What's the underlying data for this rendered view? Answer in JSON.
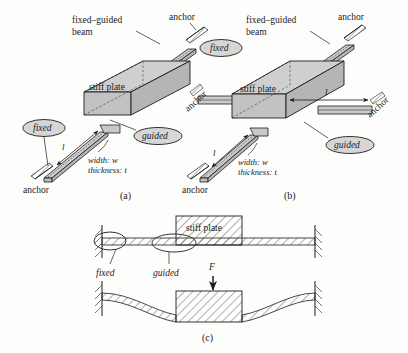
{
  "figure": {
    "caption_a": "(a)",
    "caption_b": "(b)",
    "caption_c": "(c)"
  },
  "panel_a": {
    "beam_label_line1": "fixed–guided",
    "beam_label_line2": "beam",
    "plate_label": "stiff plate",
    "anchor_top": "anchor",
    "anchor_bottom": "anchor",
    "badge_fixed": "fixed",
    "badge_guided": "guided",
    "dim_length": "l",
    "dim_width": "width: w",
    "dim_thickness": "thickness: t"
  },
  "panel_b": {
    "beam_label_line1": "fixed–guided",
    "beam_label_line2": "beam",
    "plate_label": "stiff plate",
    "anchor_top": "anchor",
    "anchor_bottom": "anchor",
    "anchor_left": "anchor",
    "anchor_right": "anchor",
    "badge_fixed": "fixed",
    "badge_guided": "guided",
    "dim_length_left": "l",
    "dim_length_right": "l",
    "dim_width": "width: w",
    "dim_thickness": "thickness: t"
  },
  "panel_c": {
    "plate_label": "stiff plate",
    "label_fixed": "fixed",
    "label_guided": "guided",
    "force_label": "F"
  },
  "colors": {
    "ink": "#1c1c1c",
    "plate_top": "#cfcfcf",
    "plate_front": "#c2c2c2",
    "plate_side": "#b5b5b5",
    "beam_fill": "#cacaca",
    "badge_fill": "#d6d6d6",
    "hatch": "#555555",
    "paper": "#fdfdfb"
  }
}
